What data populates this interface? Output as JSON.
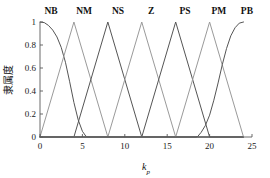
{
  "chart_data": {
    "type": "line",
    "title": "",
    "xlabel": "k_p",
    "xlabel_base": "k",
    "xlabel_sub": "p",
    "ylabel": "隶属度",
    "xlim": [
      0,
      25
    ],
    "ylim": [
      0,
      1
    ],
    "xticks": [
      "0",
      "5",
      "10",
      "15",
      "20",
      "25"
    ],
    "xtick_values": [
      0,
      5,
      10,
      15,
      20,
      25
    ],
    "yticks": [
      "0",
      "0.2",
      "0.4",
      "0.6",
      "0.8",
      "1"
    ],
    "ytick_values": [
      0,
      0.2,
      0.4,
      0.6,
      0.8,
      1
    ],
    "grid": false,
    "legend_position": "above-peaks",
    "series": [
      {
        "name": "NB",
        "label": "NB",
        "shape": "zmf",
        "color": "#555555",
        "label_x": 1.3,
        "peak_x": 0,
        "params": {
          "start": 0,
          "end": 5.6
        },
        "points_x": [
          0,
          0.5,
          1,
          1.5,
          2,
          2.5,
          3,
          3.5,
          4,
          4.5,
          5,
          5.4,
          5.6,
          24
        ],
        "points_y": [
          1,
          0.995,
          0.97,
          0.93,
          0.87,
          0.78,
          0.65,
          0.48,
          0.3,
          0.15,
          0.05,
          0.008,
          0,
          0
        ]
      },
      {
        "name": "NM",
        "label": "NM",
        "shape": "triangle",
        "color": "#9a9a9a",
        "label_x": 5.2,
        "peak_x": 4,
        "params": {
          "a": 0,
          "b": 4,
          "c": 8
        },
        "points_x": [
          0,
          4,
          8,
          24
        ],
        "points_y": [
          0,
          1,
          0,
          0
        ]
      },
      {
        "name": "NS",
        "label": "NS",
        "shape": "triangle",
        "color": "#555555",
        "label_x": 9.2,
        "peak_x": 8,
        "params": {
          "a": 4,
          "b": 8,
          "c": 12
        },
        "points_x": [
          0,
          4,
          8,
          12,
          24
        ],
        "points_y": [
          0,
          0,
          1,
          0,
          0
        ]
      },
      {
        "name": "Z",
        "label": "Z",
        "shape": "triangle",
        "color": "#9a9a9a",
        "label_x": 13.1,
        "peak_x": 12,
        "params": {
          "a": 8,
          "b": 12,
          "c": 16
        },
        "points_x": [
          0,
          8,
          12,
          16,
          24
        ],
        "points_y": [
          0,
          0,
          1,
          0,
          0
        ]
      },
      {
        "name": "PS",
        "label": "PS",
        "shape": "triangle",
        "color": "#555555",
        "label_x": 17.1,
        "peak_x": 16,
        "params": {
          "a": 12,
          "b": 16,
          "c": 20
        },
        "points_x": [
          0,
          12,
          16,
          20,
          24
        ],
        "points_y": [
          0,
          0,
          1,
          0,
          0
        ]
      },
      {
        "name": "PM",
        "label": "PM",
        "shape": "triangle",
        "color": "#9a9a9a",
        "label_x": 21.1,
        "peak_x": 20,
        "params": {
          "a": 16,
          "b": 20,
          "c": 24
        },
        "points_x": [
          0,
          16,
          20,
          24
        ],
        "points_y": [
          0,
          0,
          1,
          0
        ]
      },
      {
        "name": "PB",
        "label": "PB",
        "shape": "smf",
        "color": "#555555",
        "label_x": 24.4,
        "peak_x": 24,
        "params": {
          "start": 18.6,
          "end": 24
        },
        "points_x": [
          0,
          18.4,
          18.6,
          19,
          19.5,
          20,
          20.5,
          21,
          21.5,
          22,
          22.5,
          23,
          23.5,
          24
        ],
        "points_y": [
          0,
          0,
          0.005,
          0.04,
          0.1,
          0.19,
          0.32,
          0.47,
          0.63,
          0.77,
          0.88,
          0.95,
          0.99,
          1
        ]
      }
    ]
  },
  "axes_geometry": {
    "left": 40,
    "right": 252,
    "top": 22,
    "bottom": 137
  }
}
